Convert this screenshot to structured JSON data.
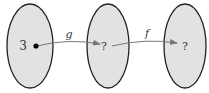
{
  "diagram": {
    "sets": [
      {
        "id": "domain-g",
        "element": "3"
      },
      {
        "id": "codomain-g",
        "element": "?"
      },
      {
        "id": "codomain-f",
        "element": "?"
      }
    ],
    "arrows": [
      {
        "id": "g",
        "label": "g"
      },
      {
        "id": "f",
        "label": "f"
      }
    ],
    "colors": {
      "set_fill": "#e2e2e2",
      "set_stroke": "#222222",
      "arrow": "#777777",
      "dot": "#000000"
    }
  }
}
